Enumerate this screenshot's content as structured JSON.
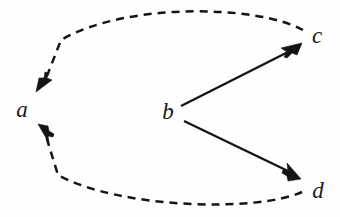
{
  "figure": {
    "kind": "directed-graph-diagram",
    "background_color": "#fefefe",
    "ink_color": "#141416",
    "width": 340,
    "height": 217
  },
  "nodes": [
    {
      "id": "a",
      "label": "a",
      "x": 22,
      "y": 109
    },
    {
      "id": "b",
      "label": "b",
      "x": 168,
      "y": 111
    },
    {
      "id": "c",
      "label": "c",
      "x": 317,
      "y": 35
    },
    {
      "id": "d",
      "label": "d",
      "x": 318,
      "y": 190
    }
  ],
  "edges": [
    {
      "id": "b-to-c",
      "from": "b",
      "to": "c",
      "style": "solid",
      "arrow": "single",
      "shape": "straight"
    },
    {
      "id": "b-to-d",
      "from": "b",
      "to": "d",
      "style": "solid",
      "arrow": "single",
      "shape": "straight"
    },
    {
      "id": "c-to-a",
      "from": "c",
      "to": "a",
      "style": "dashed",
      "arrow": "single",
      "shape": "arc-over-top"
    },
    {
      "id": "d-to-a",
      "from": "d",
      "to": "a",
      "style": "dashed",
      "arrow": "single",
      "shape": "arc-under-bottom"
    }
  ],
  "legend": {
    "solid_meaning": "",
    "dashed_meaning": ""
  }
}
